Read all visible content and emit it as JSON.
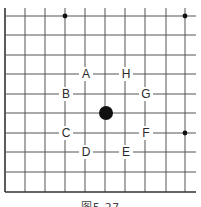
{
  "figure": {
    "caption": "图5-27",
    "board": {
      "x_lines": [
        5,
        25,
        45,
        65,
        85,
        105,
        125,
        145,
        166,
        185
      ],
      "y_lines": [
        16,
        35,
        55,
        74,
        94,
        113,
        133,
        152,
        172,
        192
      ],
      "right_edge_extent": 196,
      "top_edge_extent": 8,
      "line_color": "#555555",
      "border_color": "#333333"
    },
    "star_points": [
      {
        "x": 65,
        "y": 16
      },
      {
        "x": 185,
        "y": 16
      },
      {
        "x": 185,
        "y": 133
      }
    ],
    "stone": {
      "color": "black",
      "x": 106,
      "y": 113,
      "radius": 7
    },
    "labels": [
      {
        "text": "A",
        "x": 86,
        "y": 74
      },
      {
        "text": "H",
        "x": 126,
        "y": 74
      },
      {
        "text": "B",
        "x": 66,
        "y": 94
      },
      {
        "text": "G",
        "x": 146,
        "y": 94
      },
      {
        "text": "C",
        "x": 66,
        "y": 133
      },
      {
        "text": "F",
        "x": 146,
        "y": 133
      },
      {
        "text": "D",
        "x": 86,
        "y": 152
      },
      {
        "text": "E",
        "x": 126,
        "y": 152
      }
    ]
  }
}
